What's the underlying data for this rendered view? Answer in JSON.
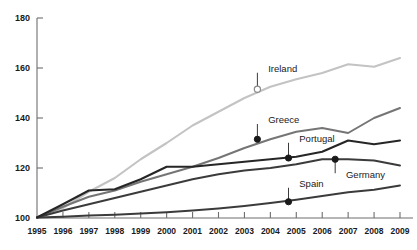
{
  "chart_data": {
    "type": "line",
    "title": "",
    "subtitle": "",
    "xlabel": "",
    "ylabel": "",
    "xlim": [
      1995,
      2009
    ],
    "ylim": [
      100,
      180
    ],
    "grid": false,
    "legend_position": "inline-labels",
    "x": [
      1995,
      1996,
      1997,
      1998,
      1999,
      2000,
      2001,
      2002,
      2003,
      2004,
      2005,
      2006,
      2007,
      2008,
      2009
    ],
    "xtick_labels": [
      "1995",
      "1996",
      "1997",
      "1998",
      "1999",
      "2000",
      "2001",
      "2002",
      "2003",
      "2004",
      "2005",
      "2006",
      "2007",
      "2008",
      "2009"
    ],
    "ytick_labels": [
      "100",
      "120",
      "140",
      "160",
      "180"
    ],
    "yticks": [
      100,
      120,
      140,
      160,
      180
    ],
    "series": [
      {
        "name": "Ireland",
        "color": "#c3c3c3",
        "width": 2.1,
        "marker": "open-circle",
        "marker_x": 2003.5,
        "marker_y": 151.5,
        "label_x": 2003.8,
        "label_y": 158.5,
        "values": [
          100.2,
          104.0,
          110.5,
          116.0,
          123.5,
          130.0,
          137.0,
          142.5,
          148.0,
          152.5,
          155.5,
          158.0,
          161.5,
          160.5,
          164.0
        ]
      },
      {
        "name": "Greece",
        "color": "#757575",
        "width": 2.0,
        "marker": "filled-circle",
        "marker_x": 2003.5,
        "marker_y": 131.5,
        "label_x": 2003.8,
        "label_y": 138.0,
        "values": [
          100.2,
          104.5,
          108.5,
          111.0,
          114.5,
          117.5,
          120.5,
          124.0,
          128.0,
          131.5,
          134.5,
          136.0,
          134.0,
          140.0,
          144.0
        ]
      },
      {
        "name": "Portugal",
        "color": "#262626",
        "width": 2.1,
        "marker": "filled-circle",
        "marker_x": 2004.7,
        "marker_y": 124.0,
        "label_x": 2005.0,
        "label_y": 130.5,
        "values": [
          100.2,
          105.5,
          111.0,
          111.5,
          115.5,
          120.5,
          120.5,
          121.5,
          122.5,
          123.5,
          124.5,
          126.5,
          131.0,
          129.5,
          131.0
        ]
      },
      {
        "name": "Germany",
        "color": "#3b3b3b",
        "width": 2.0,
        "marker": "filled-circle",
        "marker_x": 2006.5,
        "marker_y": 123.5,
        "label_x": 2006.8,
        "label_y": 117.5,
        "values": [
          100.2,
          103.0,
          105.5,
          108.0,
          110.5,
          113.0,
          115.5,
          117.5,
          119.0,
          120.0,
          121.5,
          123.5,
          123.5,
          123.0,
          121.0
        ]
      },
      {
        "name": "Spain",
        "color": "#3b3b3b",
        "width": 1.9,
        "marker": "filled-circle",
        "marker_x": 2004.7,
        "marker_y": 106.5,
        "label_x": 2005.0,
        "label_y": 112.5,
        "values": [
          100.2,
          100.5,
          101.0,
          101.3,
          101.8,
          102.3,
          103.0,
          103.8,
          104.8,
          106.0,
          107.3,
          108.8,
          110.3,
          111.3,
          113.0
        ]
      }
    ]
  }
}
